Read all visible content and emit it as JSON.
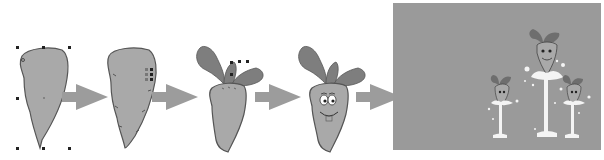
{
  "diagram": {
    "type": "process-flow",
    "colors": {
      "body_fill": "#a9a9a9",
      "outline": "#555555",
      "leaf_fill": "#7e7e7e",
      "arrow_fill": "#9c9c9c",
      "scene_bg": "#9a9a9a",
      "splash": "#f4f4f4",
      "handle": "#222222"
    },
    "steps": [
      {
        "id": 1,
        "name": "basic-shape",
        "state": "selected with transform handles"
      },
      {
        "id": 2,
        "name": "refined-shape",
        "state": "node edit markers"
      },
      {
        "id": 3,
        "name": "add-leaves",
        "state": "leaves selected"
      },
      {
        "id": 4,
        "name": "add-face",
        "state": "eyes and smile"
      },
      {
        "id": 5,
        "name": "final-scene",
        "state": "three carrots on splash jets over gray background"
      }
    ],
    "arrows": 4
  }
}
